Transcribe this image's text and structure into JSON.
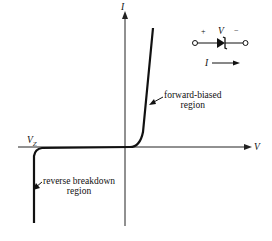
{
  "diagram": {
    "axes": {
      "x_label": "V",
      "y_label": "I"
    },
    "vz_label": "V",
    "vz_sub": "Z",
    "annotations": {
      "forward_line1": "forward-biased",
      "forward_line2": "region",
      "reverse_line1": "reverse breakdown",
      "reverse_line2": "region"
    },
    "symbol": {
      "plus": "+",
      "minus": "−",
      "voltage": "V",
      "current": "I"
    }
  }
}
